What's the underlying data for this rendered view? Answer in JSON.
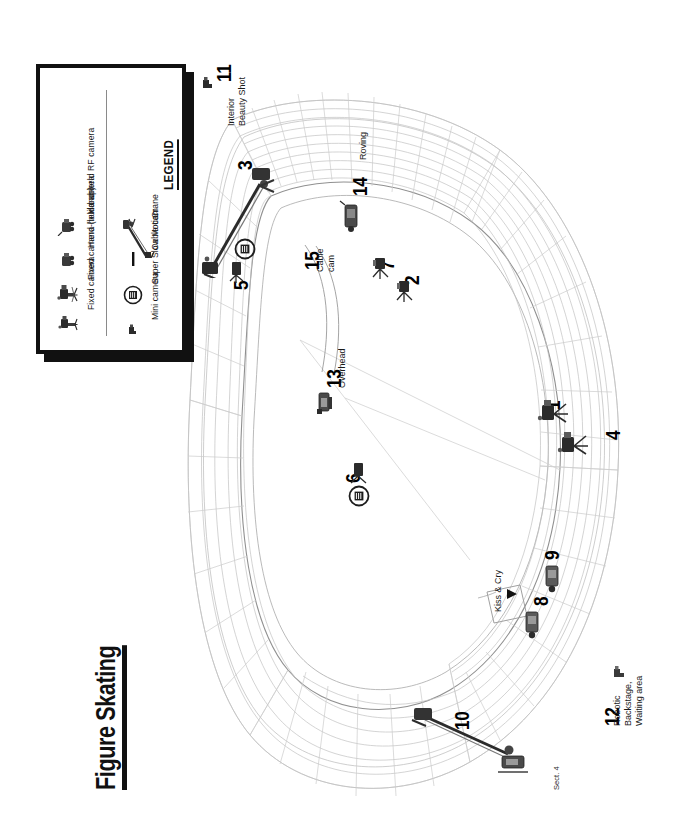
{
  "page": {
    "title": "Figure Skating",
    "background_color": "#ffffff",
    "ink_color": "#111111",
    "orientation_note": "landscape sheet rendered rotated 90 degrees counter-clockwise"
  },
  "legend": {
    "heading": "LEGEND",
    "columns": [
      {
        "items": [
          {
            "label": "Fixed camera",
            "icon": "fixed-camera-icon"
          },
          {
            "label": "Fixed camera (build-up)",
            "icon": "fixed-camera-buildup-icon"
          },
          {
            "label": "Hand-held camera",
            "icon": "hand-held-camera-icon"
          },
          {
            "label": "Hand-held RF camera",
            "icon": "hand-held-rf-camera-icon"
          }
        ]
      },
      {
        "items": [
          {
            "label": "Mini camera",
            "icon": "mini-camera-icon"
          },
          {
            "label": "Super Slow Motion",
            "icon": "super-slow-motion-icon"
          },
          {
            "label": "Cable cam",
            "icon": "cable-cam-icon"
          },
          {
            "label": "Crane",
            "icon": "crane-icon"
          }
        ]
      }
    ]
  },
  "venue": {
    "section_label": "Sect. 4",
    "kiss_and_cry_label": "Kiss & Cry"
  },
  "camera_positions": [
    {
      "number": "1",
      "note": "",
      "type": "fixed-camera-buildup-icon"
    },
    {
      "number": "2",
      "note": "",
      "type": "fixed-camera-icon"
    },
    {
      "number": "3",
      "note": "",
      "type": "crane-icon"
    },
    {
      "number": "4",
      "note": "",
      "type": "fixed-camera-buildup-icon"
    },
    {
      "number": "5",
      "note": "",
      "type": "super-slow-motion-icon"
    },
    {
      "number": "6",
      "note": "",
      "type": "super-slow-motion-icon"
    },
    {
      "number": "7",
      "note": "",
      "type": "fixed-camera-icon"
    },
    {
      "number": "8",
      "note": "",
      "type": "hand-held-camera-icon"
    },
    {
      "number": "9",
      "note": "",
      "type": "hand-held-camera-icon"
    },
    {
      "number": "10",
      "note": "",
      "type": "crane-icon"
    },
    {
      "number": "11",
      "note": "Interior\nBeauty Shot",
      "type": "mini-camera-icon"
    },
    {
      "number": "12",
      "note": "Robotic\nBackstage,\nWaiting area",
      "type": "mini-camera-icon"
    },
    {
      "number": "13",
      "note": "Overhead",
      "type": "fixed-camera-icon"
    },
    {
      "number": "14",
      "note": "Roving",
      "type": "hand-held-rf-camera-icon"
    },
    {
      "number": "15",
      "note": "Cable\ncam",
      "type": "cable-cam-icon"
    }
  ]
}
